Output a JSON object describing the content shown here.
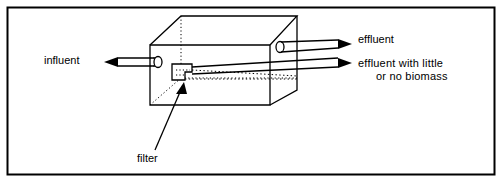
{
  "figure": {
    "type": "schematic-diagram",
    "border": {
      "color": "#000000",
      "style": "rectangular frame"
    },
    "line_color": "#000000",
    "background_color": "#ffffff",
    "labels": {
      "influent": "influent",
      "effluent": "effluent",
      "effluent_little_line1": "effluent with little",
      "effluent_little_line2": "or no biomass",
      "filter": "filter"
    },
    "elements": {
      "vessel": "open rectangular box drawn in oblique projection",
      "inlet_pipe": "horizontal pipe entering left face, drawn as two parallel lines with elliptical opening",
      "outlet_pipe_upper": "pipe exiting right face near top with elliptical opening",
      "outlet_pipe_lower": "pipe exiting right face lower, from filter",
      "filter_block": "stepped rectangular block on vessel floor",
      "hidden_edges": "dotted lines indicating concealed edges"
    },
    "arrows": {
      "influent": "right-pointing solid arrowhead",
      "effluent": "right-pointing solid arrowhead",
      "effluent_little": "right-pointing solid arrowhead",
      "filter": "up-right pointing solid arrowhead leader line"
    }
  }
}
